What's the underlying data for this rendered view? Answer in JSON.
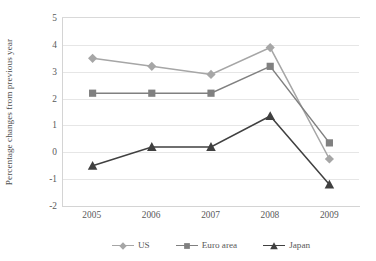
{
  "chart_data": {
    "type": "line",
    "title": "",
    "xlabel": "",
    "ylabel": "Percentage changes from previous year",
    "categories": [
      "2005",
      "2006",
      "2007",
      "2008",
      "2009"
    ],
    "ylim": [
      -2,
      5
    ],
    "ytick_step": 1,
    "yticks": [
      "5",
      "4",
      "3",
      "2",
      "1",
      "0",
      "-1",
      "-2"
    ],
    "grid": "horizontal",
    "legend_position": "bottom",
    "series": [
      {
        "name": "US",
        "marker": "diamond",
        "color": "#a6a6a6",
        "values": [
          3.5,
          3.2,
          2.9,
          3.9,
          -0.25
        ]
      },
      {
        "name": "Euro area",
        "marker": "square",
        "color": "#808080",
        "values": [
          2.2,
          2.2,
          2.2,
          3.2,
          0.35
        ]
      },
      {
        "name": "Japan",
        "marker": "triangle",
        "color": "#404040",
        "values": [
          -0.5,
          0.2,
          0.2,
          1.35,
          -1.2
        ]
      }
    ]
  },
  "colors": {
    "gridline": "#e6e6e6",
    "axis": "#d4d4d4",
    "text": "#595959",
    "background": "#ffffff"
  }
}
